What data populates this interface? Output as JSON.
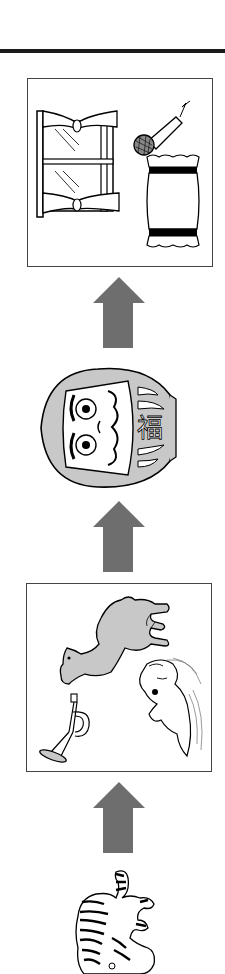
{
  "puzzle": {
    "type": "shiritori word chain",
    "direction": "bottom-to-top",
    "arrow_color": "#6e6e6e",
    "steps": [
      {
        "position": 1,
        "kind": "single",
        "item": {
          "name": "tiger",
          "reading": "tora"
        }
      },
      {
        "position": 2,
        "kind": "choice-box",
        "items": [
          {
            "name": "camel",
            "reading": "rakuda"
          },
          {
            "name": "trumpet",
            "reading": "rappa"
          },
          {
            "name": "otter",
            "reading": "kawauso"
          }
        ]
      },
      {
        "position": 3,
        "kind": "single",
        "item": {
          "name": "daruma doll",
          "reading": "daruma",
          "kanji": "福"
        }
      },
      {
        "position": 4,
        "kind": "choice-box",
        "items": [
          {
            "name": "window",
            "reading": "mado"
          },
          {
            "name": "microphone",
            "reading": "maiku"
          },
          {
            "name": "pillow",
            "reading": "makura"
          }
        ]
      }
    ]
  }
}
